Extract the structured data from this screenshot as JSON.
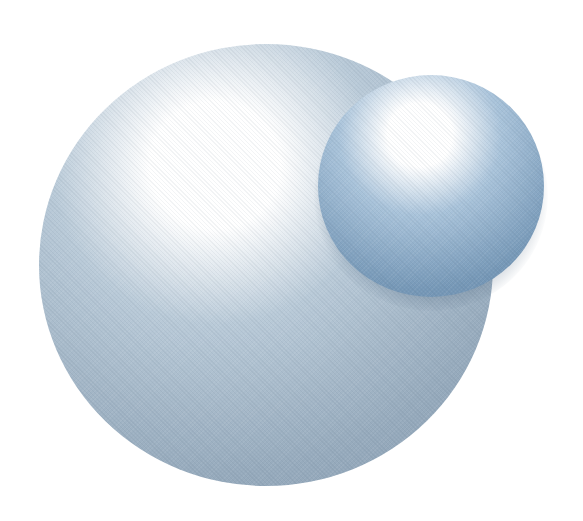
{
  "scene": {
    "width": 583,
    "height": 521,
    "background": "#ffffff"
  },
  "spheres": [
    {
      "name": "large-sphere",
      "center_x": 266,
      "center_y": 265,
      "radius_x": 227,
      "radius_y": 221,
      "highlight_x": 215,
      "highlight_y": 165,
      "colors": {
        "highlight": "#ffffff",
        "mid": "#b9cad8",
        "body": "#97abbd",
        "edge": "#7d93a8"
      }
    },
    {
      "name": "small-sphere",
      "center_x": 431,
      "center_y": 186,
      "radius_x": 113,
      "radius_y": 111,
      "highlight_x": 420,
      "highlight_y": 135,
      "colors": {
        "highlight": "#ffffff",
        "mid": "#a9c3da",
        "body": "#7698b7",
        "edge": "#5f82a4"
      }
    }
  ]
}
